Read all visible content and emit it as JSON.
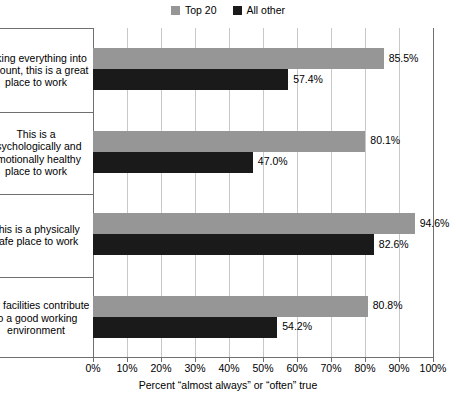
{
  "chart_data": {
    "type": "bar",
    "orientation": "horizontal",
    "title": "",
    "xlabel": "Percent “almost always” or “often” true",
    "ylabel": "",
    "xlim": [
      0,
      100
    ],
    "xticks": [
      "0%",
      "10%",
      "20%",
      "30%",
      "40%",
      "50%",
      "60%",
      "70%",
      "80%",
      "90%",
      "100%"
    ],
    "grid": true,
    "legend_position": "top-center",
    "categories": [
      "Taking everything into account, this is a great place to work",
      "This is a psychologically and emotionally healthy place to work",
      "This is a physically safe place to work",
      "Our facilities contribute to a good working environment"
    ],
    "series": [
      {
        "name": "Top 20",
        "color": "#969696",
        "values": [
          85.5,
          80.1,
          94.6,
          80.8
        ],
        "labels": [
          "85.5%",
          "80.1%",
          "94.6%",
          "80.8%"
        ]
      },
      {
        "name": "All other",
        "color": "#1a1a1a",
        "values": [
          57.4,
          47.0,
          82.6,
          54.2
        ],
        "labels": [
          "57.4%",
          "47.0%",
          "82.6%",
          "54.2%"
        ]
      }
    ]
  },
  "legend": {
    "items": [
      {
        "label": "Top 20",
        "color": "#969696"
      },
      {
        "label": "All other",
        "color": "#1a1a1a"
      }
    ]
  },
  "axis": {
    "x_title": "Percent “almost always” or “often” true"
  }
}
